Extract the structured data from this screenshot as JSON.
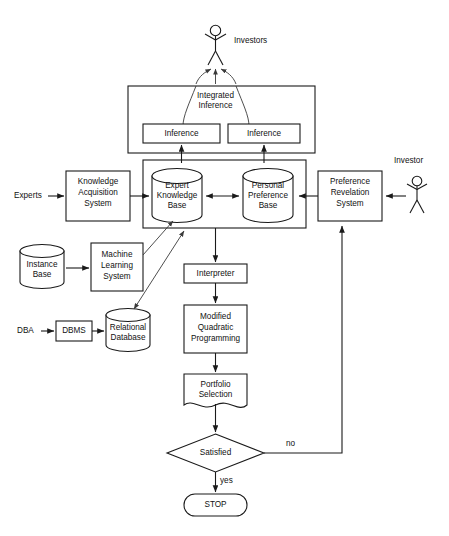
{
  "diagram": {
    "type": "flowchart",
    "colors": {
      "stroke": "#1a1a1a",
      "background": "#ffffff",
      "text": "#111111"
    },
    "actors": [
      {
        "id": "investors",
        "label": "Investors",
        "icon": "stick-figure-icon"
      },
      {
        "id": "investor",
        "label": "Investor",
        "icon": "stick-figure-icon"
      }
    ],
    "external_labels": [
      {
        "id": "experts",
        "label": "Experts"
      },
      {
        "id": "dba",
        "label": "DBA"
      }
    ],
    "nodes": {
      "integrated_inference": {
        "line1": "Integrated",
        "line2": "Inference"
      },
      "inference_left": {
        "label": "Inference"
      },
      "inference_right": {
        "label": "Inference"
      },
      "knowledge_acquisition_system": {
        "line1": "Knowledge",
        "line2": "Acquisition",
        "line3": "System"
      },
      "expert_knowledge_base": {
        "line1": "Expert",
        "line2": "Knowledge",
        "line3": "Base"
      },
      "personal_preference_base": {
        "line1": "Personal",
        "line2": "Preference",
        "line3": "Base"
      },
      "preference_revelation_system": {
        "line1": "Preference",
        "line2": "Revelation",
        "line3": "System"
      },
      "instance_base": {
        "line1": "Instance",
        "line2": "Base"
      },
      "machine_learning_system": {
        "line1": "Machine",
        "line2": "Learning",
        "line3": "System"
      },
      "dbms": {
        "label": "DBMS"
      },
      "relational_database": {
        "line1": "Relational",
        "line2": "Database"
      },
      "interpreter": {
        "label": "Interpreter"
      },
      "modified_quadratic_programming": {
        "line1": "Modified",
        "line2": "Quadratic",
        "line3": "Programming"
      },
      "portfolio_selection": {
        "line1": "Portfolio",
        "line2": "Selection"
      },
      "satisfied_decision": {
        "label": "Satisfied"
      },
      "stop_terminator": {
        "label": "STOP"
      }
    },
    "edge_labels": {
      "decision_no": "no",
      "decision_yes": "yes"
    }
  }
}
